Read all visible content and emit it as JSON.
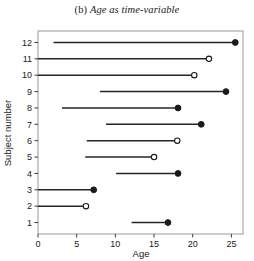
{
  "chart_data": {
    "type": "line",
    "title_prefix": "(b) ",
    "title": "Age as time-variable",
    "xlabel": "Age",
    "ylabel": "Subject number",
    "xlim": [
      0,
      26.5
    ],
    "ylim": [
      0.3,
      12.7
    ],
    "xticks": [
      0,
      5,
      10,
      15,
      20,
      25
    ],
    "xtick_labels": [
      "0",
      "5",
      "10",
      "15",
      "20",
      "25"
    ],
    "yticks": [
      1,
      2,
      3,
      4,
      5,
      6,
      7,
      8,
      9,
      10,
      11,
      12
    ],
    "ytick_labels": [
      "1",
      "2",
      "3",
      "4",
      "5",
      "6",
      "7",
      "8",
      "9",
      "10",
      "11",
      "12"
    ],
    "grid": false,
    "marker_filled_meaning": "event",
    "marker_open_meaning": "censored",
    "series": [
      {
        "name": "subject-12",
        "subject": 12,
        "start": 2.0,
        "end": 25.5,
        "censored": false
      },
      {
        "name": "subject-11",
        "subject": 11,
        "start": 0.0,
        "end": 22.1,
        "censored": true
      },
      {
        "name": "subject-10",
        "subject": 10,
        "start": 0.0,
        "end": 20.2,
        "censored": true
      },
      {
        "name": "subject-9",
        "subject": 9,
        "start": 8.0,
        "end": 24.3,
        "censored": false
      },
      {
        "name": "subject-8",
        "subject": 8,
        "start": 3.1,
        "end": 18.1,
        "censored": false
      },
      {
        "name": "subject-7",
        "subject": 7,
        "start": 8.8,
        "end": 21.1,
        "censored": false
      },
      {
        "name": "subject-6",
        "subject": 6,
        "start": 6.3,
        "end": 18.0,
        "censored": true
      },
      {
        "name": "subject-5",
        "subject": 5,
        "start": 6.1,
        "end": 15.0,
        "censored": true
      },
      {
        "name": "subject-4",
        "subject": 4,
        "start": 10.1,
        "end": 18.1,
        "censored": false
      },
      {
        "name": "subject-3",
        "subject": 3,
        "start": 0.0,
        "end": 7.2,
        "censored": false
      },
      {
        "name": "subject-2",
        "subject": 2,
        "start": 0.0,
        "end": 6.2,
        "censored": true
      },
      {
        "name": "subject-1",
        "subject": 1,
        "start": 12.1,
        "end": 16.8,
        "censored": false
      }
    ]
  },
  "style": {
    "line_color": "#262626",
    "frame_color": "#9a9a9a",
    "marker_fill": "#1a1a1a",
    "marker_open_fill": "#ffffff"
  }
}
